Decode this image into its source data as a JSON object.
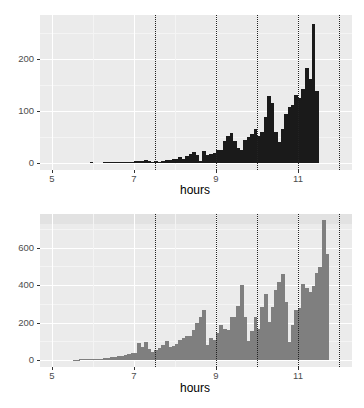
{
  "chart_data": [
    {
      "type": "bar",
      "title": "",
      "xlabel": "hours",
      "ylabel": "",
      "bar_color": "#1a1a1a",
      "bin_width_hours": 0.0833,
      "x_start": 5.5,
      "xlim": [
        4.8,
        12.4
      ],
      "ylim": [
        0,
        280
      ],
      "x_ticks": [
        5,
        7,
        9,
        11
      ],
      "y_ticks": [
        0,
        100,
        200
      ],
      "vlines": [
        7.5,
        9,
        10,
        11,
        12
      ],
      "vline_style": "dotted",
      "grid": true,
      "values": [
        0,
        0,
        0,
        0,
        0,
        1,
        0,
        0,
        0,
        1,
        1,
        1,
        1,
        1,
        1,
        1,
        1,
        1,
        4,
        3,
        3,
        5,
        3,
        2,
        3,
        2,
        4,
        5,
        6,
        8,
        7,
        12,
        8,
        13,
        18,
        22,
        15,
        3,
        23,
        15,
        18,
        20,
        25,
        25,
        42,
        52,
        57,
        42,
        28,
        25,
        45,
        50,
        55,
        65,
        52,
        60,
        88,
        128,
        115,
        60,
        40,
        65,
        95,
        108,
        112,
        130,
        125,
        142,
        182,
        162,
        268,
        138
      ]
    },
    {
      "type": "bar",
      "title": "",
      "xlabel": "hours",
      "ylabel": "",
      "bar_color": "#7f7f7f",
      "bin_width_hours": 0.0833,
      "x_start": 5.5,
      "xlim": [
        4.8,
        12.4
      ],
      "ylim": [
        0,
        760
      ],
      "x_ticks": [
        5,
        7,
        9,
        11
      ],
      "y_ticks": [
        0,
        200,
        400,
        600
      ],
      "vlines": [
        7.5,
        9,
        10,
        11,
        12
      ],
      "vline_style": "dotted",
      "grid": true,
      "values": [
        2,
        2,
        3,
        3,
        4,
        5,
        6,
        7,
        8,
        10,
        12,
        14,
        16,
        20,
        24,
        26,
        30,
        36,
        38,
        90,
        70,
        95,
        60,
        45,
        55,
        65,
        80,
        100,
        70,
        75,
        85,
        105,
        115,
        130,
        130,
        160,
        200,
        230,
        265,
        80,
        120,
        105,
        145,
        185,
        165,
        160,
        230,
        230,
        290,
        400,
        230,
        100,
        155,
        230,
        165,
        285,
        350,
        205,
        285,
        375,
        415,
        460,
        310,
        95,
        185,
        265,
        280,
        405,
        385,
        365,
        395,
        465,
        495,
        745,
        565
      ]
    }
  ],
  "charts": [
    {
      "xlabel": "hours",
      "y_tick_labels": [
        "0",
        "100",
        "200"
      ],
      "x_tick_labels": [
        "5",
        "7",
        "9",
        "11"
      ]
    },
    {
      "xlabel": "hours",
      "y_tick_labels": [
        "0",
        "200",
        "400",
        "600"
      ],
      "x_tick_labels": [
        "5",
        "7",
        "9",
        "11"
      ]
    }
  ]
}
